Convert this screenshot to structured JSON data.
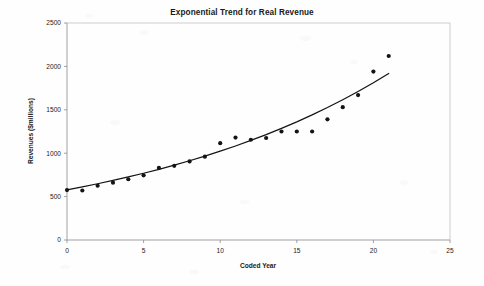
{
  "chart_data": {
    "type": "scatter",
    "title": "Exponential Trend for Real Revenue",
    "xlabel": "Coded Year",
    "ylabel": "Revenues ($millions)",
    "xlim": [
      0,
      25
    ],
    "ylim": [
      0,
      2500
    ],
    "xticks": [
      "0",
      "5",
      "10",
      "15",
      "20",
      "25"
    ],
    "yticks": [
      "0",
      "500",
      "1000",
      "1500",
      "2000",
      "2500"
    ],
    "xtick_values": [
      0,
      5,
      10,
      15,
      20,
      25
    ],
    "ytick_values": [
      0,
      500,
      1000,
      1500,
      2000,
      2500
    ],
    "grid": false,
    "legend": "none",
    "marker": "filled-circle",
    "marker_color": "#141414",
    "curve_color": "#141414",
    "x": [
      0,
      1,
      2,
      3,
      4,
      5,
      6,
      7,
      8,
      9,
      10,
      11,
      12,
      13,
      14,
      15,
      16,
      17,
      18,
      19,
      20,
      21
    ],
    "values": [
      575,
      570,
      625,
      660,
      700,
      745,
      830,
      855,
      905,
      960,
      1115,
      1180,
      1155,
      1175,
      1250,
      1250,
      1250,
      1390,
      1530,
      1670,
      1940,
      2120
    ],
    "series": [
      {
        "name": "Real Revenue",
        "type": "scatter",
        "values": [
          575,
          570,
          625,
          660,
          700,
          745,
          830,
          855,
          905,
          960,
          1115,
          1180,
          1155,
          1175,
          1250,
          1250,
          1250,
          1390,
          1530,
          1670,
          1940,
          2120
        ]
      },
      {
        "name": "Exponential trend",
        "type": "line",
        "values": [
          578,
          612,
          648,
          686,
          726,
          769,
          814,
          862,
          913,
          966,
          1023,
          1083,
          1147,
          1214,
          1286,
          1361,
          1441,
          1526,
          1616,
          1711,
          1811,
          1918
        ]
      }
    ]
  }
}
